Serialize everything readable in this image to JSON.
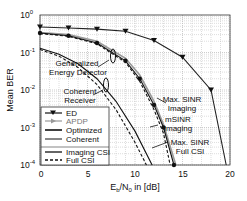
{
  "chart_data": {
    "type": "line",
    "title": "",
    "xlabel": "E_b/N_0 in [dB]",
    "ylabel": "Mean BER",
    "xlim": [
      0,
      20
    ],
    "ylim": [
      0.0001,
      1
    ],
    "yscale": "log",
    "grid": true,
    "x_ticks": [
      "0",
      "5",
      "10",
      "15",
      "20"
    ],
    "y_ticks": [
      "10^0",
      "10^-1",
      "10^-2",
      "10^-3",
      "10^-4"
    ],
    "legend_position": "lower-left",
    "legend": [
      "ED",
      "APDP",
      "Optimized",
      "Coherent",
      "Imaging CSI",
      "Full CSI"
    ],
    "annotations": [
      "Generalized Energy Detector",
      "Coherent Receiver",
      "Max. SINR Imaging",
      "mSINR Imaging",
      "Max. SINR Full CSI"
    ],
    "series": [
      {
        "name": "ED",
        "style": "solid-triangle",
        "color": "#222222",
        "x": [
          0,
          3,
          6,
          9,
          12,
          15,
          18,
          19.6
        ],
        "y": [
          0.48,
          0.45,
          0.42,
          0.37,
          0.21,
          0.075,
          0.01,
          0.0001
        ]
      },
      {
        "name": "APDP (Imaging CSI)",
        "style": "gray-arrow",
        "color": "#999999",
        "x": [
          0,
          3,
          6,
          9,
          10.5,
          12,
          13,
          14.3
        ],
        "y": [
          0.34,
          0.3,
          0.2,
          0.07,
          0.025,
          0.005,
          0.0012,
          0.0001
        ]
      },
      {
        "name": "Generalized ED Imaging CSI",
        "style": "solid",
        "color": "#111111",
        "x": [
          0,
          3,
          6,
          9,
          10.5,
          12,
          13,
          14.1
        ],
        "y": [
          0.33,
          0.28,
          0.18,
          0.06,
          0.02,
          0.004,
          0.001,
          0.0001
        ]
      },
      {
        "name": "Generalized ED Full CSI",
        "style": "dashed",
        "color": "#111111",
        "x": [
          0,
          3,
          6,
          9,
          10.5,
          12,
          13,
          13.7
        ],
        "y": [
          0.32,
          0.27,
          0.17,
          0.055,
          0.017,
          0.003,
          0.0007,
          0.0001
        ]
      },
      {
        "name": "Coherent Imaging CSI",
        "style": "solid",
        "color": "#111111",
        "x": [
          0,
          2,
          4,
          6,
          8,
          10,
          11.8
        ],
        "y": [
          0.13,
          0.09,
          0.05,
          0.02,
          0.005,
          0.0008,
          0.0001
        ]
      },
      {
        "name": "Coherent Full CSI",
        "style": "dashed",
        "color": "#111111",
        "x": [
          0,
          2,
          4,
          6,
          8,
          10,
          11.2
        ],
        "y": [
          0.12,
          0.08,
          0.04,
          0.014,
          0.003,
          0.0004,
          0.0001
        ]
      }
    ]
  },
  "axes": {
    "xlabel": "E_b/N_0 in [dB]",
    "ylabel": "Mean BER",
    "x_ticks": [
      {
        "label": "0"
      },
      {
        "label": "5"
      },
      {
        "label": "10"
      },
      {
        "label": "15"
      },
      {
        "label": "20"
      }
    ],
    "y_ticks": [
      {
        "base": "10",
        "exp": "0"
      },
      {
        "base": "10",
        "exp": "-1"
      },
      {
        "base": "10",
        "exp": "-2"
      },
      {
        "base": "10",
        "exp": "-3"
      },
      {
        "base": "10",
        "exp": "-4"
      }
    ]
  },
  "legend": {
    "items": [
      {
        "label": "ED"
      },
      {
        "label": "APDP"
      },
      {
        "label": "Optimized"
      },
      {
        "label": "Coherent"
      },
      {
        "label": "Imaging CSI"
      },
      {
        "label": "Full CSI"
      }
    ]
  },
  "annotations": {
    "ged_line1": "Generalized",
    "ged_line2": "Energy Detector",
    "coh_line1": "Coherent",
    "coh_line2": "Receiver",
    "maxsinr_line1": "Max. SINR",
    "maxsinr_line2": "Imaging",
    "msinr_line1": "mSINR",
    "msinr_line2": "Imaging",
    "maxfull_line1": "Max. SINR",
    "maxfull_line2": "Full CSI"
  }
}
